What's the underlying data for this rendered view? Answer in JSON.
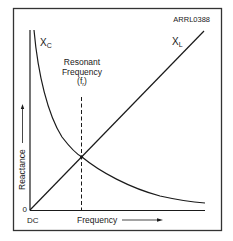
{
  "figure_id": "ARRL0388",
  "labels": {
    "xc_main": "X",
    "xc_sub": "C",
    "xl_main": "X",
    "xl_sub": "L",
    "resonant_line1": "Resonant",
    "resonant_line2": "Frequency",
    "resonant_line3_open": "(f",
    "resonant_line3_sub": "r",
    "resonant_line3_close": ")",
    "y_axis": "Reactance",
    "x_axis": "Frequency",
    "origin_y": "0",
    "origin_x": "DC"
  },
  "colors": {
    "line": "#1a1a1a",
    "frame": "#333333",
    "background": "#ffffff"
  }
}
